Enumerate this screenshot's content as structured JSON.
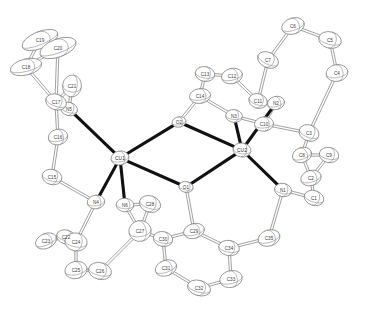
{
  "figure": {
    "type": "crystal-structure-thermal-ellipsoid-plot",
    "width": 371,
    "height": 310,
    "background_color": "#ffffff",
    "outline_color": "#7a7a7a",
    "metal_bond_color": "#111111",
    "ligand_bond_color": "#6e6e6e"
  },
  "atoms": [
    {
      "label": "CU1",
      "kind": "metal",
      "x": 120,
      "y": 158,
      "rx": 9.0,
      "ry": 7.0,
      "rot": -10
    },
    {
      "label": "CU2",
      "kind": "metal",
      "x": 242,
      "y": 150,
      "rx": 9.0,
      "ry": 7.0,
      "rot": 8
    },
    {
      "label": "O2",
      "kind": "oxygen",
      "x": 179,
      "y": 122,
      "rx": 7.0,
      "ry": 5.2,
      "rot": -12
    },
    {
      "label": "O1",
      "kind": "oxygen",
      "x": 186,
      "y": 187,
      "rx": 7.2,
      "ry": 5.4,
      "rot": 10
    },
    {
      "label": "N1",
      "kind": "nitrogen",
      "x": 283,
      "y": 190,
      "rx": 8.6,
      "ry": 6.6,
      "rot": 12
    },
    {
      "label": "N2",
      "kind": "nitrogen",
      "x": 276,
      "y": 103,
      "rx": 8.6,
      "ry": 6.6,
      "rot": -14
    },
    {
      "label": "N3",
      "kind": "nitrogen",
      "x": 234,
      "y": 116,
      "rx": 8.4,
      "ry": 6.4,
      "rot": 6
    },
    {
      "label": "N4",
      "kind": "nitrogen",
      "x": 96,
      "y": 202,
      "rx": 8.8,
      "ry": 6.8,
      "rot": -8
    },
    {
      "label": "N5",
      "kind": "nitrogen",
      "x": 69,
      "y": 109,
      "rx": 8.6,
      "ry": 6.6,
      "rot": 16
    },
    {
      "label": "N6",
      "kind": "nitrogen",
      "x": 125,
      "y": 205,
      "rx": 8.8,
      "ry": 6.8,
      "rot": 4
    },
    {
      "label": "C1",
      "kind": "carbon",
      "x": 314,
      "y": 198,
      "rx": 10.0,
      "ry": 7.4,
      "rot": 18
    },
    {
      "label": "C2",
      "kind": "carbon",
      "x": 311,
      "y": 178,
      "rx": 10.4,
      "ry": 7.6,
      "rot": -16
    },
    {
      "label": "C3",
      "kind": "carbon",
      "x": 309,
      "y": 133,
      "rx": 10.2,
      "ry": 8.0,
      "rot": 22
    },
    {
      "label": "C4",
      "kind": "carbon",
      "x": 337,
      "y": 73,
      "rx": 11.0,
      "ry": 8.4,
      "rot": -10
    },
    {
      "label": "C5",
      "kind": "carbon",
      "x": 330,
      "y": 40,
      "rx": 11.4,
      "ry": 8.2,
      "rot": 14
    },
    {
      "label": "C6",
      "kind": "carbon",
      "x": 293,
      "y": 26,
      "rx": 11.6,
      "ry": 8.0,
      "rot": -18
    },
    {
      "label": "C7",
      "kind": "carbon",
      "x": 268,
      "y": 60,
      "rx": 11.0,
      "ry": 7.6,
      "rot": 26
    },
    {
      "label": "C8",
      "kind": "carbon",
      "x": 302,
      "y": 155,
      "rx": 9.8,
      "ry": 7.4,
      "rot": -20
    },
    {
      "label": "C9",
      "kind": "carbon",
      "x": 329,
      "y": 155,
      "rx": 9.8,
      "ry": 7.6,
      "rot": 12
    },
    {
      "label": "C10",
      "kind": "carbon",
      "x": 264,
      "y": 124,
      "rx": 9.6,
      "ry": 7.2,
      "rot": -6
    },
    {
      "label": "C11",
      "kind": "carbon",
      "x": 258,
      "y": 101,
      "rx": 9.4,
      "ry": 7.2,
      "rot": 18
    },
    {
      "label": "C12",
      "kind": "carbon",
      "x": 232,
      "y": 76,
      "rx": 10.6,
      "ry": 7.6,
      "rot": -14
    },
    {
      "label": "C13",
      "kind": "carbon",
      "x": 205,
      "y": 74,
      "rx": 9.8,
      "ry": 7.4,
      "rot": 10
    },
    {
      "label": "C14",
      "kind": "carbon",
      "x": 200,
      "y": 96,
      "rx": 10.6,
      "ry": 7.4,
      "rot": -8
    },
    {
      "label": "C15",
      "kind": "carbon",
      "x": 52,
      "y": 177,
      "rx": 10.0,
      "ry": 7.6,
      "rot": 14
    },
    {
      "label": "C16",
      "kind": "carbon",
      "x": 58,
      "y": 137,
      "rx": 9.8,
      "ry": 7.8,
      "rot": -12
    },
    {
      "label": "C17",
      "kind": "carbon",
      "x": 56,
      "y": 102,
      "rx": 10.6,
      "ry": 7.8,
      "rot": 20
    },
    {
      "label": "C18",
      "kind": "carbon",
      "x": 26,
      "y": 67,
      "rx": 16.0,
      "ry": 8.0,
      "rot": -14
    },
    {
      "label": "C19",
      "kind": "carbon",
      "x": 40,
      "y": 40,
      "rx": 19.0,
      "ry": 8.4,
      "rot": -22
    },
    {
      "label": "C20",
      "kind": "carbon",
      "x": 58,
      "y": 48,
      "rx": 19.0,
      "ry": 9.0,
      "rot": -20
    },
    {
      "label": "C21",
      "kind": "carbon",
      "x": 72,
      "y": 86,
      "rx": 9.4,
      "ry": 11.0,
      "rot": 8
    },
    {
      "label": "C22",
      "kind": "carbon",
      "x": 66,
      "y": 237,
      "rx": 9.6,
      "ry": 7.0,
      "rot": 16
    },
    {
      "label": "C23",
      "kind": "carbon",
      "x": 46,
      "y": 241,
      "rx": 11.0,
      "ry": 7.4,
      "rot": -24
    },
    {
      "label": "C24",
      "kind": "carbon",
      "x": 76,
      "y": 242,
      "rx": 11.2,
      "ry": 9.0,
      "rot": 10
    },
    {
      "label": "C25",
      "kind": "carbon",
      "x": 76,
      "y": 270,
      "rx": 11.2,
      "ry": 8.6,
      "rot": -12
    },
    {
      "label": "C26",
      "kind": "carbon",
      "x": 100,
      "y": 271,
      "rx": 11.6,
      "ry": 8.4,
      "rot": 14
    },
    {
      "label": "C27",
      "kind": "carbon",
      "x": 140,
      "y": 231,
      "rx": 11.2,
      "ry": 10.4,
      "rot": -10
    },
    {
      "label": "C28",
      "kind": "carbon",
      "x": 150,
      "y": 204,
      "rx": 10.8,
      "ry": 8.2,
      "rot": 18
    },
    {
      "label": "C29",
      "kind": "carbon",
      "x": 194,
      "y": 231,
      "rx": 10.6,
      "ry": 7.4,
      "rot": -16
    },
    {
      "label": "C30",
      "kind": "carbon",
      "x": 163,
      "y": 239,
      "rx": 9.8,
      "ry": 7.4,
      "rot": 12
    },
    {
      "label": "C31",
      "kind": "carbon",
      "x": 166,
      "y": 268,
      "rx": 11.0,
      "ry": 7.8,
      "rot": -20
    },
    {
      "label": "C32",
      "kind": "carbon",
      "x": 199,
      "y": 288,
      "rx": 11.8,
      "ry": 7.6,
      "rot": 16
    },
    {
      "label": "C33",
      "kind": "carbon",
      "x": 231,
      "y": 279,
      "rx": 11.4,
      "ry": 8.4,
      "rot": -14
    },
    {
      "label": "C34",
      "kind": "carbon",
      "x": 229,
      "y": 248,
      "rx": 10.4,
      "ry": 7.6,
      "rot": 10
    },
    {
      "label": "C35",
      "kind": "carbon",
      "x": 269,
      "y": 238,
      "rx": 11.2,
      "ry": 8.0,
      "rot": -18
    }
  ],
  "metal_bonds": [
    {
      "from": "CU1",
      "to": "O2"
    },
    {
      "from": "CU1",
      "to": "O1"
    },
    {
      "from": "CU2",
      "to": "O2"
    },
    {
      "from": "CU2",
      "to": "O1"
    },
    {
      "from": "CU1",
      "to": "N5"
    },
    {
      "from": "CU1",
      "to": "N4"
    },
    {
      "from": "CU1",
      "to": "N6"
    },
    {
      "from": "CU2",
      "to": "N3"
    },
    {
      "from": "CU2",
      "to": "N2"
    },
    {
      "from": "CU2",
      "to": "N1"
    }
  ],
  "ligand_bonds": [
    {
      "from": "N5",
      "to": "C21"
    },
    {
      "from": "N5",
      "to": "C17"
    },
    {
      "from": "C17",
      "to": "C21"
    },
    {
      "from": "C17",
      "to": "C20"
    },
    {
      "from": "C17",
      "to": "C16"
    },
    {
      "from": "C20",
      "to": "C19"
    },
    {
      "from": "C20",
      "to": "C18"
    },
    {
      "from": "C19",
      "to": "C18"
    },
    {
      "from": "C18",
      "to": "C17"
    },
    {
      "from": "C16",
      "to": "C15"
    },
    {
      "from": "C15",
      "to": "N4"
    },
    {
      "from": "N4",
      "to": "C24"
    },
    {
      "from": "N6",
      "to": "C28"
    },
    {
      "from": "N6",
      "to": "C27"
    },
    {
      "from": "C24",
      "to": "C22"
    },
    {
      "from": "C22",
      "to": "C23"
    },
    {
      "from": "C24",
      "to": "C25"
    },
    {
      "from": "C25",
      "to": "C26"
    },
    {
      "from": "C26",
      "to": "C27"
    },
    {
      "from": "C27",
      "to": "C28"
    },
    {
      "from": "C27",
      "to": "C30"
    },
    {
      "from": "C30",
      "to": "C29"
    },
    {
      "from": "C30",
      "to": "C31"
    },
    {
      "from": "C29",
      "to": "C34"
    },
    {
      "from": "C31",
      "to": "C32"
    },
    {
      "from": "C32",
      "to": "C33"
    },
    {
      "from": "C33",
      "to": "C34"
    },
    {
      "from": "C34",
      "to": "C35"
    },
    {
      "from": "C35",
      "to": "N1"
    },
    {
      "from": "N1",
      "to": "C1"
    },
    {
      "from": "C1",
      "to": "C2"
    },
    {
      "from": "C2",
      "to": "C8"
    },
    {
      "from": "C8",
      "to": "C9"
    },
    {
      "from": "C8",
      "to": "C3"
    },
    {
      "from": "C2",
      "to": "C9"
    },
    {
      "from": "C3",
      "to": "C4"
    },
    {
      "from": "C4",
      "to": "C5"
    },
    {
      "from": "C5",
      "to": "C6"
    },
    {
      "from": "C6",
      "to": "C7"
    },
    {
      "from": "C7",
      "to": "C11"
    },
    {
      "from": "C11",
      "to": "N2"
    },
    {
      "from": "C11",
      "to": "C12"
    },
    {
      "from": "N2",
      "to": "C10"
    },
    {
      "from": "C10",
      "to": "C3"
    },
    {
      "from": "C12",
      "to": "C13"
    },
    {
      "from": "C13",
      "to": "C14"
    },
    {
      "from": "C14",
      "to": "N3"
    },
    {
      "from": "C29",
      "to": "O1"
    },
    {
      "from": "C14",
      "to": "O2"
    },
    {
      "from": "N3",
      "to": "C10"
    }
  ]
}
